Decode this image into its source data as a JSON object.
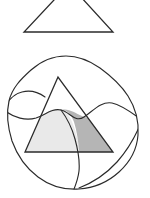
{
  "figure": {
    "canvas": {
      "width": 150,
      "height": 198,
      "background": "#ffffff"
    },
    "colors": {
      "stroke": "#2b2b2b",
      "background": "#ffffff",
      "region_light_fill": "#e9e9e9",
      "region_dark_fill": "#b5b5b5",
      "unshaded_fill": "#ffffff"
    },
    "shapes": [
      {
        "name": "top-triangle",
        "kind": "triangle",
        "filled": false,
        "fill": "#ffffff",
        "clipped_at_top": true,
        "vertices": [
          {
            "label": "apex",
            "x": 69,
            "y": -16
          },
          {
            "label": "bottom-left",
            "x": 24,
            "y": 32
          },
          {
            "label": "bottom-right",
            "x": 113,
            "y": 32
          }
        ],
        "base_y": 32,
        "base_left_x": 24,
        "base_right_x": 113
      },
      {
        "name": "lower-blob",
        "kind": "closed-curve",
        "filled": false,
        "fill": "#ffffff",
        "bounds": {
          "x": 7,
          "y": 56,
          "width": 131,
          "height": 134
        }
      },
      {
        "name": "inner-triangle",
        "kind": "triangle",
        "filled": false,
        "vertices": [
          {
            "label": "apex",
            "x": 58,
            "y": 77
          },
          {
            "label": "bottom-left",
            "x": 25,
            "y": 152
          },
          {
            "label": "bottom-right",
            "x": 113,
            "y": 152
          }
        ],
        "base_y": 152,
        "base_left_x": 25,
        "base_right_x": 113
      }
    ],
    "regions": [
      {
        "name": "left-shaded-region",
        "shade": "light",
        "fill": "#e9e9e9",
        "position": "lower-left of inner triangle"
      },
      {
        "name": "right-shaded-region",
        "shade": "dark",
        "fill": "#b5b5b5",
        "position": "lower-right of inner triangle"
      },
      {
        "name": "upper-unshaded-region",
        "shade": "none",
        "fill": "#ffffff",
        "position": "upper part of inner triangle"
      }
    ],
    "dividing_curves": [
      {
        "name": "wavy-horizontal-curve",
        "description": "S-shaped curve crossing the blob left to right"
      },
      {
        "name": "vertical-partition-curve",
        "description": "curve descending from the wavy curve through the triangle base"
      },
      {
        "name": "upper-left-arc",
        "description": "short arc near left edge of the blob"
      },
      {
        "name": "lower-right-arc",
        "description": "arc near lower right edge of the blob"
      }
    ],
    "labels": []
  }
}
